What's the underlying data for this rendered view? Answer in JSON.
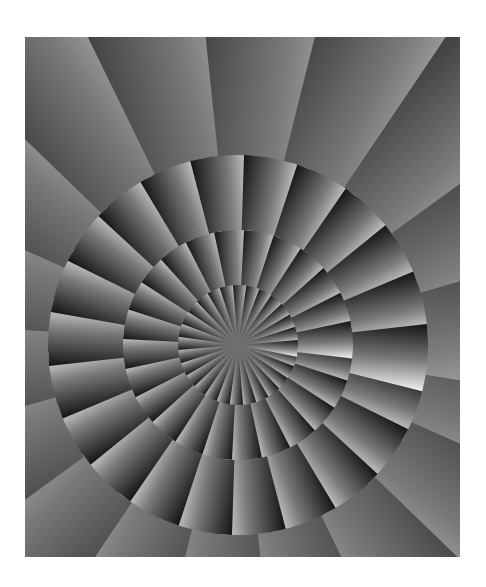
{
  "image": {
    "description": "Abstract grayscale op-art spiral of overlapping gradient fan wedges radiating from a central point",
    "colors": {
      "background": "#ffffff",
      "dark": "#141414",
      "mid": "#7a7a7a",
      "light": "#e8e8e8"
    },
    "frame": {
      "x": 25,
      "y": 37,
      "width": 435,
      "height": 520
    },
    "center": {
      "x": 213,
      "y": 308
    },
    "rings": [
      {
        "radius": 700,
        "count": 18,
        "offset_deg": 4
      },
      {
        "radius": 190,
        "count": 22,
        "offset_deg": 10
      },
      {
        "radius": 115,
        "count": 24,
        "offset_deg": 3
      },
      {
        "radius": 60,
        "count": 28,
        "offset_deg": 8
      }
    ]
  }
}
